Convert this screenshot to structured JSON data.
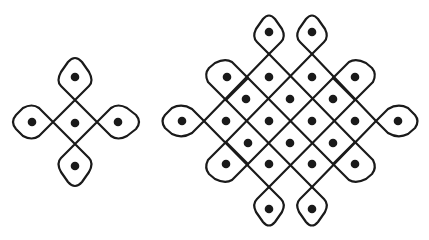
{
  "figure": {
    "line_color": "#1a1a1a",
    "background": "#ffffff",
    "kolams": [
      {
        "name": "small-kolam",
        "dots": [
          [
            75,
            77
          ],
          [
            32,
            122
          ],
          [
            75,
            123
          ],
          [
            118,
            122
          ],
          [
            75,
            166
          ]
        ]
      },
      {
        "name": "large-kolam",
        "dots": [
          [
            269,
            32
          ],
          [
            312,
            32
          ],
          [
            227,
            77
          ],
          [
            269,
            77
          ],
          [
            312,
            77
          ],
          [
            355,
            77
          ],
          [
            246,
            99
          ],
          [
            290,
            99
          ],
          [
            333,
            99
          ],
          [
            182,
            121
          ],
          [
            226,
            121
          ],
          [
            269,
            121
          ],
          [
            312,
            121
          ],
          [
            355,
            121
          ],
          [
            398,
            121
          ],
          [
            248,
            143
          ],
          [
            290,
            143
          ],
          [
            333,
            143
          ],
          [
            226,
            164
          ],
          [
            269,
            164
          ],
          [
            312,
            164
          ],
          [
            355,
            164
          ],
          [
            269,
            209
          ],
          [
            312,
            209
          ]
        ]
      }
    ]
  }
}
